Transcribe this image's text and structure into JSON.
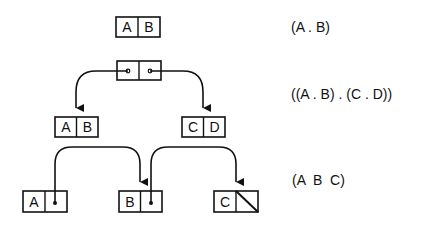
{
  "diagram": {
    "stroke_color": "#111111",
    "rows": [
      {
        "notation": "(A . B)",
        "cells": [
          {
            "car": "A",
            "cdr": "B"
          }
        ]
      },
      {
        "notation": "((A . B) . (C . D))",
        "cells": [
          {
            "car": "pointer",
            "cdr": "pointer"
          },
          {
            "car": "A",
            "cdr": "B"
          },
          {
            "car": "C",
            "cdr": "D"
          }
        ]
      },
      {
        "notation": "(A  B  C)",
        "cells": [
          {
            "car": "A",
            "cdr": "pointer"
          },
          {
            "car": "B",
            "cdr": "pointer"
          },
          {
            "car": "C",
            "cdr": "nil"
          }
        ]
      }
    ]
  },
  "labels": {
    "top_car": "A",
    "top_cdr": "B",
    "left_car": "A",
    "left_cdr": "B",
    "right_car": "C",
    "right_cdr": "D",
    "list_a": "A",
    "list_b": "B",
    "list_c": "C"
  }
}
